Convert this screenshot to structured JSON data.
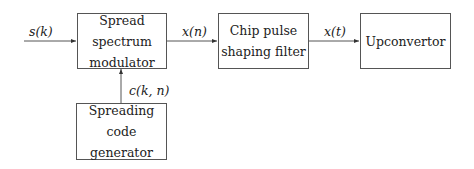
{
  "diagram": {
    "type": "block-diagram",
    "blocks": [
      {
        "id": "ssm",
        "label": "Spread spectrum modulator",
        "lines": [
          "Spread spectrum",
          "modulator"
        ]
      },
      {
        "id": "cpsf",
        "label": "Chip pulse shaping filter",
        "lines": [
          "Chip pulse",
          "shaping filter"
        ]
      },
      {
        "id": "upc",
        "label": "Upconvertor",
        "lines": [
          "Upconvertor"
        ]
      },
      {
        "id": "scg",
        "label": "Spreading code generator",
        "lines": [
          "Spreading code",
          "generator"
        ]
      }
    ],
    "signals": [
      {
        "label": "s(k)",
        "from": "input",
        "to": "ssm"
      },
      {
        "label": "x(n)",
        "from": "ssm",
        "to": "cpsf"
      },
      {
        "label": "x(t)",
        "from": "cpsf",
        "to": "upc"
      },
      {
        "label": "c(k, n)",
        "from": "scg",
        "to": "ssm"
      }
    ],
    "colors": {
      "line": "#555555",
      "text": "#222222",
      "background": "#ffffff"
    }
  }
}
